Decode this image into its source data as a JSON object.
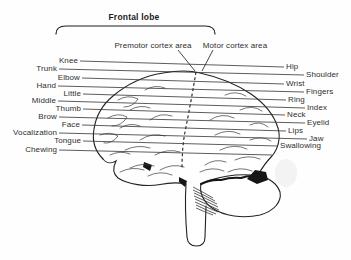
{
  "diagram": {
    "title": "Frontal lobe",
    "cortex_labels": {
      "premotor": "Premotor cortex area",
      "motor": "Motor cortex area"
    },
    "left_labels": [
      "Knee",
      "Trunk",
      "Elbow",
      "Hand",
      "Little",
      "Middle",
      "Thumb",
      "Brow",
      "Face",
      "Vocalization",
      "Tongue",
      "Chewing"
    ],
    "right_labels": [
      "Hip",
      "Shoulder",
      "Wrist",
      "Fingers",
      "Ring",
      "Index",
      "Neck",
      "Eyelid",
      "Lips",
      "Jaw",
      "Swallowing"
    ],
    "colors": {
      "ink": "#222222",
      "text": "#2e2e2e",
      "background": "#fefefe"
    }
  }
}
